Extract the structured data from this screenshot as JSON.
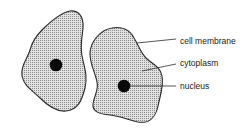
{
  "diagram": {
    "type": "cell diagram",
    "cells": [
      {
        "id": "cell-left",
        "has_nucleus": true
      },
      {
        "id": "cell-right",
        "has_nucleus": true
      }
    ],
    "labels": {
      "membrane": "cell membrane",
      "cytoplasm": "cytoplasm",
      "nucleus": "nucleus"
    },
    "colors": {
      "outline": "#2a2a2a",
      "fill": "#d9d9d9",
      "stipple": "#8a8a8a",
      "nucleus": "#0a0a0a",
      "text": "#1a1a1a"
    }
  }
}
